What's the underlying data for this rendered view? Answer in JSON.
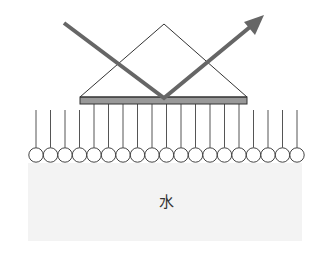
{
  "diagram": {
    "label_water": "水",
    "colors": {
      "stroke": "#333333",
      "beam": "#666666",
      "plate": "#999999",
      "water": "#f3f3f3"
    },
    "prism": {
      "apex": [
        164,
        24
      ],
      "base_left": [
        80,
        97
      ],
      "base_right": [
        247,
        97
      ]
    },
    "plate": {
      "x": 80,
      "y": 97,
      "width": 167,
      "height": 7
    },
    "beam": {
      "start": [
        64,
        23
      ],
      "reflect": [
        164,
        98
      ],
      "end": [
        262,
        17
      ]
    },
    "molecules": {
      "count": 19,
      "first_cx": 36,
      "spacing": 14.5,
      "cy": 155,
      "r": 7.2,
      "tail_top_outer": 110,
      "tail_top_inner": 105
    },
    "water": {
      "x": 28,
      "y": 163,
      "width": 274,
      "height": 78
    }
  }
}
